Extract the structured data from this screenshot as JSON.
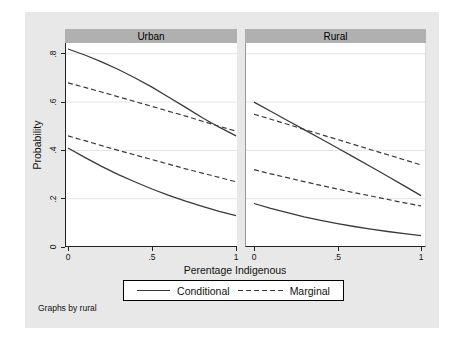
{
  "colors": {
    "line": "#3a3a3a",
    "grid": "#e4e4e4",
    "strip_bg": "#b0b0b0",
    "figure_bg": "#e8e8e8",
    "plot_bg": "#ffffff",
    "axis": "#222222"
  },
  "note": "Graphs by rural",
  "chart_data": {
    "type": "line",
    "title": "",
    "xlabel": "Perentage Indigenous",
    "ylabel": "Probability",
    "xlim": [
      0,
      1
    ],
    "ylim": [
      0,
      0.84
    ],
    "grid": "horizontal",
    "legend_position": "bottom-center-boxed",
    "x": [
      0,
      0.1,
      0.2,
      0.3,
      0.4,
      0.5,
      0.6,
      0.7,
      0.8,
      0.9,
      1
    ],
    "x_ticks": [
      0,
      0.5,
      1
    ],
    "x_tick_labels": [
      "0",
      ".5",
      "1"
    ],
    "y_ticks": [
      0,
      0.2,
      0.4,
      0.6,
      0.8
    ],
    "y_tick_labels": [
      "0",
      ".2",
      ".4",
      ".6",
      ".8"
    ],
    "panels": [
      {
        "title": "Urban",
        "series": [
          {
            "name": "Conditional (upper)",
            "legend": "Conditional",
            "style": "solid",
            "values": [
              0.82,
              0.795,
              0.767,
              0.735,
              0.7,
              0.662,
              0.62,
              0.578,
              0.535,
              0.496,
              0.46
            ]
          },
          {
            "name": "Marginal (upper)",
            "legend": "Marginal",
            "style": "dashed",
            "values": [
              0.68,
              0.661,
              0.642,
              0.622,
              0.602,
              0.582,
              0.562,
              0.542,
              0.521,
              0.5,
              0.48
            ]
          },
          {
            "name": "Marginal (lower)",
            "legend": "Marginal",
            "style": "dashed",
            "values": [
              0.46,
              0.44,
              0.42,
              0.4,
              0.381,
              0.362,
              0.343,
              0.324,
              0.306,
              0.288,
              0.27
            ]
          },
          {
            "name": "Conditional (lower)",
            "legend": "Conditional",
            "style": "solid",
            "values": [
              0.41,
              0.371,
              0.334,
              0.3,
              0.269,
              0.24,
              0.214,
              0.19,
              0.168,
              0.148,
              0.13
            ]
          }
        ]
      },
      {
        "title": "Rural",
        "series": [
          {
            "name": "Conditional (upper)",
            "legend": "Conditional",
            "style": "solid",
            "values": [
              0.6,
              0.562,
              0.524,
              0.486,
              0.448,
              0.41,
              0.371,
              0.332,
              0.293,
              0.253,
              0.213
            ]
          },
          {
            "name": "Marginal (upper)",
            "legend": "Marginal",
            "style": "dashed",
            "values": [
              0.55,
              0.529,
              0.508,
              0.487,
              0.466,
              0.445,
              0.424,
              0.403,
              0.382,
              0.361,
              0.34
            ]
          },
          {
            "name": "Marginal (lower)",
            "legend": "Marginal",
            "style": "dashed",
            "values": [
              0.32,
              0.303,
              0.287,
              0.271,
              0.255,
              0.24,
              0.225,
              0.211,
              0.197,
              0.183,
              0.17
            ]
          },
          {
            "name": "Conditional (lower)",
            "legend": "Conditional",
            "style": "solid",
            "values": [
              0.18,
              0.16,
              0.142,
              0.125,
              0.11,
              0.097,
              0.085,
              0.074,
              0.064,
              0.055,
              0.047
            ]
          }
        ]
      }
    ],
    "legend": [
      {
        "label": "Conditional",
        "style": "solid"
      },
      {
        "label": "Marginal",
        "style": "dashed"
      }
    ],
    "note": "Graphs by rural"
  }
}
